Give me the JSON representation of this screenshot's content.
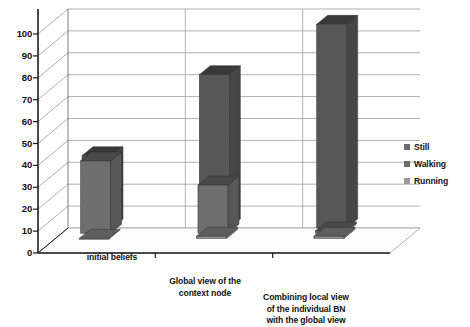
{
  "chart_data": {
    "type": "bar",
    "title": "",
    "subtitle": "",
    "xlabel": "",
    "ylabel": "",
    "ylim": [
      0,
      100
    ],
    "ytick_step": 10,
    "yticks": [
      100,
      90,
      80,
      70,
      60,
      50,
      40,
      30,
      20,
      10,
      0
    ],
    "grid": true,
    "style": "3d-grouped-column",
    "legend_position": "right",
    "categories": [
      "initial beliefs",
      "Global view of the context node",
      "Combining local view of the individual BN with the global view"
    ],
    "category_lines": [
      [
        "initial beliefs"
      ],
      [
        "Global view of the",
        "context node"
      ],
      [
        "Combining local view",
        "of the individual BN",
        "with the global view"
      ]
    ],
    "series": [
      {
        "name": "Still",
        "color": "#575757",
        "values": [
          33,
          70,
          93
        ]
      },
      {
        "name": "Walking",
        "color": "#6e6e6e",
        "values": [
          33,
          22,
          1
        ]
      },
      {
        "name": "Running",
        "color": "#8f8f8f",
        "values": [
          0,
          1,
          1
        ]
      }
    ]
  },
  "legend": {
    "items": [
      {
        "label": "Still",
        "swatch": "#6b6b6b"
      },
      {
        "label": "Walking",
        "swatch": "#6b6b6b"
      },
      {
        "label": "Running",
        "swatch": "#9a9a9a"
      }
    ]
  },
  "axis": {
    "ytick_labels": [
      "100",
      "90",
      "80",
      "70",
      "60",
      "50",
      "40",
      "30",
      "20",
      "10",
      "0"
    ]
  },
  "colors": {
    "bar_front_dark": "#575757",
    "bar_front_mid": "#6e6e6e",
    "bar_front_light": "#8f8f8f",
    "bar_top": "#3f3f3f",
    "bar_side": "#444444",
    "gridline": "#9c9c9c",
    "axis_line": "#1c1c1c",
    "floor": "#ffffff",
    "background": "#ffffff"
  }
}
